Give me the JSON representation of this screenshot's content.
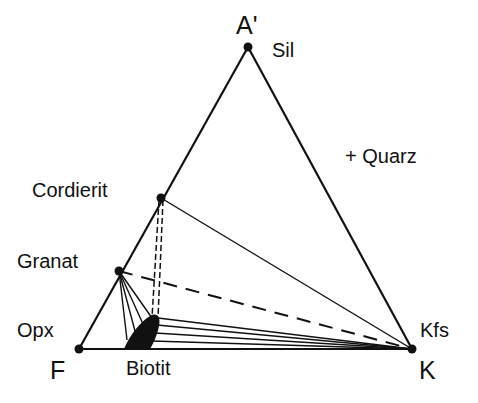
{
  "diagram": {
    "type": "ternary-phase-diagram",
    "vertices": {
      "top": {
        "label": "A'",
        "mineral": "Sil"
      },
      "left": {
        "label": "F",
        "mineral": "Opx"
      },
      "right": {
        "label": "K",
        "mineral": "Kfs"
      }
    },
    "phases": [
      "Sil",
      "Cordierit",
      "Granat",
      "Opx",
      "Biotit",
      "Kfs"
    ],
    "annotation": "+ Quarz",
    "labels": {
      "a_prime": "A'",
      "sil": "Sil",
      "quarz": "+ Quarz",
      "cordierit": "Cordierit",
      "granat": "Granat",
      "opx": "Opx",
      "kfs": "Kfs",
      "f": "F",
      "biotit": "Biotit",
      "k": "K"
    },
    "tie_lines": [
      {
        "from": "Cordierit",
        "to": "Kfs",
        "style": "solid"
      },
      {
        "from": "Granat",
        "to": "Kfs",
        "style": "dashed"
      },
      {
        "from": "Cordierit",
        "to": "Biotit",
        "style": "double-dashed"
      },
      {
        "from": "Granat",
        "to": "Biotit",
        "style": "solid-fan"
      },
      {
        "from": "Biotit",
        "to": "Kfs",
        "style": "solid-fan"
      }
    ],
    "colors": {
      "ink": "#111111",
      "background": "#ffffff"
    }
  }
}
